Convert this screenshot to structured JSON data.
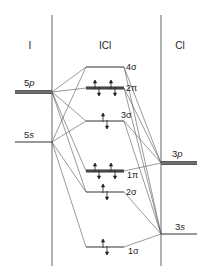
{
  "diagram": {
    "type": "molecular-orbital-diagram",
    "columns": {
      "left": "I",
      "center": "ICl",
      "right": "Cl"
    },
    "left_atom_orbitals": [
      {
        "id": "I5p",
        "label_num": "5",
        "label_sub": "p",
        "y": 92,
        "degenerate": true
      },
      {
        "id": "I5s",
        "label_num": "5",
        "label_sub": "s",
        "y": 142,
        "degenerate": false
      }
    ],
    "right_atom_orbitals": [
      {
        "id": "Cl3p",
        "label_num": "3",
        "label_sub": "p",
        "y": 163,
        "degenerate": true
      },
      {
        "id": "Cl3s",
        "label_num": "3",
        "label_sub": "s",
        "y": 234,
        "degenerate": false
      }
    ],
    "molecular_orbitals": [
      {
        "id": "4sigma",
        "label": "4σ",
        "y": 67,
        "electrons": 0,
        "degenerate": false
      },
      {
        "id": "2pi",
        "label": "2π",
        "y": 88,
        "electrons": 4,
        "degenerate": true
      },
      {
        "id": "3sigma",
        "label": "3σ",
        "y": 121,
        "electrons": 2,
        "degenerate": false
      },
      {
        "id": "1pi",
        "label": "1π",
        "y": 171,
        "electrons": 4,
        "degenerate": true
      },
      {
        "id": "2sigma",
        "label": "2σ",
        "y": 192,
        "electrons": 2,
        "degenerate": false
      },
      {
        "id": "1sigma",
        "label": "1σ",
        "y": 247,
        "electrons": 2,
        "degenerate": false
      }
    ],
    "colors": {
      "line": "#333333",
      "divider": "#555555",
      "background": "#ffffff"
    }
  }
}
